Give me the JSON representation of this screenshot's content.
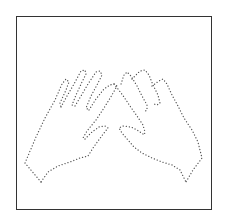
{
  "figure": {
    "caption": "",
    "colors": {
      "background": "#ffffff",
      "frame": "#333333",
      "dots": "#555555"
    }
  }
}
